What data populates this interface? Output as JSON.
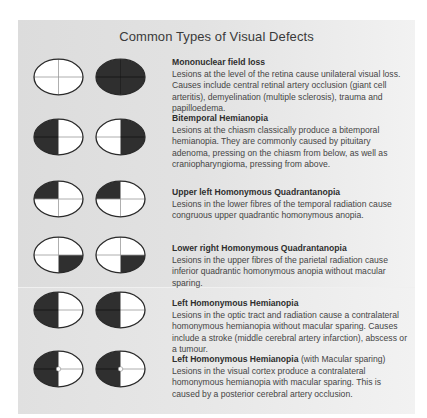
{
  "title": "Common Types of Visual Defects",
  "colors": {
    "defect_fill": "#2f2f2f",
    "field_fill": "#ffffff",
    "outline": "#2a2a2a",
    "crosshair_on_white": "#9a9a9a",
    "crosshair_on_dark": "#111111"
  },
  "defects": [
    {
      "heading": "Mononuclear field loss",
      "heading_suffix": "",
      "description": "Lesions at the level of the retina cause unilateral visual loss. Causes include central retinal artery occlusion (giant cell arteritis), demyelination (multiple sclerosis), trauma and papilloedema.",
      "left_eye": {
        "dark_quadrants": [],
        "macular_sparing": false
      },
      "right_eye": {
        "dark_quadrants": [
          "upper-left",
          "upper-right",
          "lower-left",
          "lower-right"
        ],
        "macular_sparing": false
      }
    },
    {
      "heading": "Bitemporal Hemianopia",
      "heading_suffix": "",
      "description": "Lesions at the chiasm classically produce a bitemporal hemianopia. They are commonly caused by pituitary adenoma, pressing on the chiasm from below, as well as craniopharyngioma, pressing from above.",
      "left_eye": {
        "dark_quadrants": [
          "upper-left",
          "lower-left"
        ],
        "macular_sparing": false
      },
      "right_eye": {
        "dark_quadrants": [
          "upper-right",
          "lower-right"
        ],
        "macular_sparing": false
      }
    },
    {
      "heading": "Upper left Homonymous Quadrantanopia",
      "heading_suffix": "",
      "description": "Lesions in the lower fibres of the temporal radiation cause congruous upper quadrantic homonymous anopia.",
      "left_eye": {
        "dark_quadrants": [
          "upper-left"
        ],
        "macular_sparing": false
      },
      "right_eye": {
        "dark_quadrants": [
          "upper-left"
        ],
        "macular_sparing": false
      }
    },
    {
      "heading": "Lower right Homonymous Quadrantanopia",
      "heading_suffix": "",
      "description": "Lesions in the upper fibres of the parietal radiation cause inferior quadrantic homonymous anopia without macular sparing.",
      "left_eye": {
        "dark_quadrants": [
          "lower-right"
        ],
        "macular_sparing": false
      },
      "right_eye": {
        "dark_quadrants": [
          "lower-right"
        ],
        "macular_sparing": false
      }
    },
    {
      "heading": "Left Homonymous Hemianopia",
      "heading_suffix": "",
      "description": "Lesions in the optic tract and radiation cause a contralateral homonymous hemianopia without macular sparing. Causes include a stroke (middle cerebral artery infarction), abscess or a tumour.",
      "left_eye": {
        "dark_quadrants": [
          "upper-left",
          "lower-left"
        ],
        "macular_sparing": false
      },
      "right_eye": {
        "dark_quadrants": [
          "upper-left",
          "lower-left"
        ],
        "macular_sparing": false
      }
    },
    {
      "heading": "Left Homonymous Hemianopia",
      "heading_suffix": " (with Macular sparing)",
      "description": "Lesions in the visual cortex produce a contralateral homonymous hemianopia with macular sparing. This is caused by a posterior cerebral artery occlusion.",
      "left_eye": {
        "dark_quadrants": [
          "upper-left",
          "lower-left"
        ],
        "macular_sparing": true
      },
      "right_eye": {
        "dark_quadrants": [
          "upper-left",
          "lower-left"
        ],
        "macular_sparing": true
      }
    }
  ]
}
